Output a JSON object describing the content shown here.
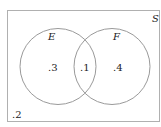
{
  "diagram": {
    "type": "venn",
    "universe": {
      "label": "S"
    },
    "sets": [
      {
        "label": "E",
        "only_value": ".3"
      },
      {
        "label": "F",
        "only_value": ".4"
      }
    ],
    "intersection_value": ".1",
    "outside_value": ".2",
    "colors": {
      "stroke": "#9a9a9a",
      "border": "#b0b0b0",
      "text": "#222222"
    }
  }
}
